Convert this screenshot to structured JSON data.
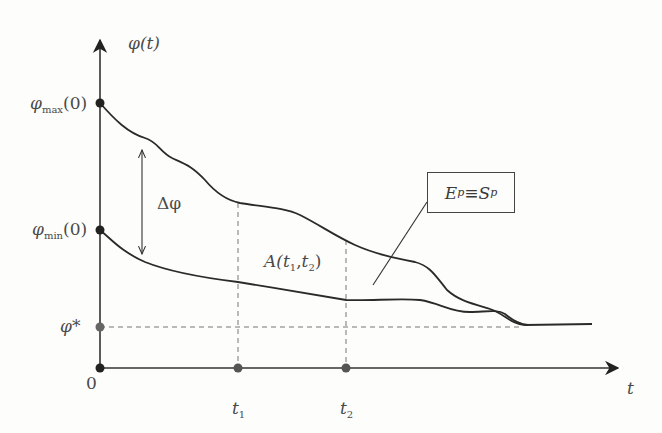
{
  "diagram": {
    "y_axis_label": "φ(t)",
    "x_axis_label": "t",
    "origin_label": "0",
    "y_ticks": {
      "phi_max": {
        "symbol": "φ",
        "sub": "max",
        "arg": "(0)"
      },
      "phi_min": {
        "symbol": "φ",
        "sub": "min",
        "arg": "(0)"
      },
      "phi_star": "φ*"
    },
    "x_ticks": {
      "t1": {
        "symbol": "t",
        "sub": "1"
      },
      "t2": {
        "symbol": "t",
        "sub": "2"
      }
    },
    "delta_label": "Δφ",
    "area_label": {
      "prefix": "A(",
      "t1": "t",
      "s1": "1",
      "sep": ",",
      "t2": "t",
      "s2": "2",
      "suffix": ")"
    },
    "callout": {
      "left": "E",
      "left_sub": "p",
      "equiv": " ≡ ",
      "right": "S",
      "right_sub": "p"
    },
    "colors": {
      "line": "#2a2a2a",
      "dashed": "#777777",
      "marker_dark": "#222222",
      "marker_gray": "#666666"
    }
  }
}
